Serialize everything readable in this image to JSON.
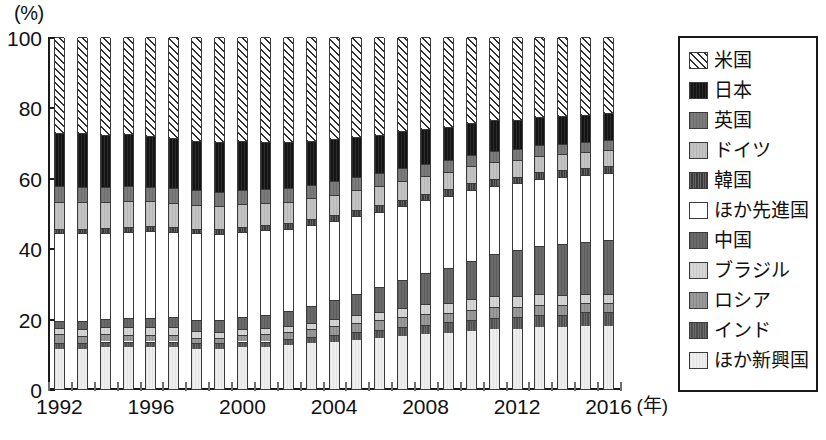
{
  "axes": {
    "y_unit": "(%)",
    "y_ticks": [
      0,
      20,
      40,
      60,
      80,
      100
    ],
    "x_unit": "(年)",
    "x_labels": [
      "1992",
      "1996",
      "2000",
      "2004",
      "2008",
      "2012",
      "2016"
    ]
  },
  "legend": {
    "items": [
      {
        "label": "米国",
        "key": "us",
        "fill": "#ffffff",
        "pattern": "diagonal-hatch"
      },
      {
        "label": "日本",
        "key": "jp",
        "fill": "#141414",
        "pattern": "solid"
      },
      {
        "label": "英国",
        "key": "uk",
        "fill": "#7b7b7b",
        "pattern": "solid"
      },
      {
        "label": "ドイツ",
        "key": "de",
        "fill": "#c4c4c4",
        "pattern": "solid"
      },
      {
        "label": "韓国",
        "key": "kr",
        "fill": "#3a3a3a",
        "pattern": "vertical-lines"
      },
      {
        "label": "ほか先進国",
        "key": "adv",
        "fill": "#ffffff",
        "pattern": "none"
      },
      {
        "label": "中国",
        "key": "cn",
        "fill": "#6a6a6a",
        "pattern": "solid"
      },
      {
        "label": "ブラジル",
        "key": "br",
        "fill": "#d6d6d6",
        "pattern": "solid"
      },
      {
        "label": "ロシア",
        "key": "ru",
        "fill": "#9a9a9a",
        "pattern": "solid"
      },
      {
        "label": "インド",
        "key": "in",
        "fill": "#4f4f4f",
        "pattern": "vertical-lines"
      },
      {
        "label": "ほか新興国",
        "key": "emg",
        "fill": "#eeeeee",
        "pattern": "solid"
      }
    ]
  },
  "chart_data": {
    "type": "bar",
    "stacked": true,
    "title": "",
    "xlabel": "(年)",
    "ylabel": "(%)",
    "ylim": [
      0,
      100
    ],
    "grid": false,
    "legend_position": "right",
    "categories": [
      "1992",
      "1993",
      "1994",
      "1995",
      "1996",
      "1997",
      "1998",
      "1999",
      "2000",
      "2001",
      "2002",
      "2003",
      "2004",
      "2005",
      "2006",
      "2007",
      "2008",
      "2009",
      "2010",
      "2011",
      "2012",
      "2013",
      "2014",
      "2015",
      "2016"
    ],
    "stack_order_bottom_to_top": [
      "emg",
      "in",
      "ru",
      "br",
      "cn",
      "adv",
      "kr",
      "de",
      "uk",
      "jp",
      "us"
    ],
    "series": [
      {
        "name": "ほか新興国",
        "key": "emg",
        "values": [
          11.5,
          11.5,
          12.0,
          12.0,
          12.0,
          12.0,
          11.5,
          11.5,
          12.0,
          12.0,
          12.5,
          13.0,
          13.5,
          14.0,
          14.5,
          15.0,
          15.5,
          16.0,
          16.5,
          17.0,
          17.0,
          17.5,
          17.5,
          18.0,
          18.0
        ]
      },
      {
        "name": "インド",
        "key": "in",
        "values": [
          1.5,
          1.5,
          1.5,
          1.5,
          1.5,
          1.5,
          1.5,
          1.5,
          1.5,
          1.5,
          1.6,
          1.8,
          2.0,
          2.2,
          2.4,
          2.6,
          2.8,
          3.0,
          3.2,
          3.3,
          3.4,
          3.5,
          3.6,
          3.8,
          4.0
        ]
      },
      {
        "name": "ロシア",
        "key": "ru",
        "values": [
          2.5,
          2.2,
          2.0,
          1.8,
          1.8,
          1.8,
          1.5,
          1.5,
          1.8,
          2.0,
          2.0,
          2.2,
          2.4,
          2.5,
          2.6,
          2.8,
          3.0,
          2.6,
          2.8,
          3.0,
          3.0,
          3.0,
          2.8,
          2.5,
          2.4
        ]
      },
      {
        "name": "ブラジル",
        "key": "br",
        "values": [
          1.8,
          1.8,
          2.0,
          2.2,
          2.2,
          2.2,
          2.0,
          1.8,
          1.8,
          1.8,
          1.8,
          1.8,
          2.0,
          2.2,
          2.4,
          2.6,
          2.8,
          2.8,
          3.0,
          3.0,
          3.0,
          2.9,
          2.8,
          2.6,
          2.5
        ]
      },
      {
        "name": "中国",
        "key": "cn",
        "values": [
          2.0,
          2.2,
          2.4,
          2.6,
          2.8,
          3.0,
          3.2,
          3.3,
          3.5,
          3.8,
          4.2,
          4.8,
          5.4,
          6.2,
          7.0,
          8.0,
          9.0,
          10.0,
          11.0,
          12.0,
          13.0,
          13.8,
          14.5,
          15.0,
          15.5
        ]
      },
      {
        "name": "ほか先進国",
        "key": "adv",
        "values": [
          25.0,
          25.0,
          24.5,
          24.5,
          24.5,
          24.0,
          24.5,
          24.5,
          24.0,
          24.0,
          23.5,
          23.0,
          22.5,
          22.0,
          21.5,
          21.0,
          20.5,
          20.5,
          20.0,
          19.5,
          19.0,
          19.0,
          19.0,
          19.0,
          19.0
        ]
      },
      {
        "name": "韓国",
        "key": "kr",
        "values": [
          1.3,
          1.3,
          1.4,
          1.5,
          1.5,
          1.5,
          1.3,
          1.4,
          1.5,
          1.5,
          1.6,
          1.6,
          1.7,
          1.7,
          1.8,
          1.8,
          1.8,
          1.8,
          1.9,
          1.9,
          1.9,
          1.9,
          1.9,
          1.9,
          1.9
        ]
      },
      {
        "name": "ドイツ",
        "key": "de",
        "values": [
          7.5,
          7.5,
          7.2,
          7.2,
          7.0,
          6.8,
          6.8,
          6.6,
          6.4,
          6.2,
          6.0,
          6.0,
          5.8,
          5.6,
          5.5,
          5.4,
          5.2,
          5.0,
          4.9,
          4.8,
          4.7,
          4.6,
          4.6,
          4.5,
          4.5
        ]
      },
      {
        "name": "英国",
        "key": "uk",
        "values": [
          4.5,
          4.4,
          4.3,
          4.3,
          4.2,
          4.2,
          4.1,
          4.0,
          4.0,
          4.0,
          3.9,
          3.8,
          3.8,
          3.7,
          3.6,
          3.5,
          3.4,
          3.3,
          3.2,
          3.2,
          3.1,
          3.1,
          3.0,
          3.0,
          3.0
        ]
      },
      {
        "name": "日本",
        "key": "jp",
        "values": [
          15.0,
          15.2,
          15.0,
          14.8,
          14.5,
          14.2,
          14.0,
          14.2,
          14.0,
          13.5,
          13.0,
          12.5,
          12.0,
          11.5,
          11.0,
          10.5,
          10.0,
          9.5,
          9.0,
          8.6,
          8.3,
          8.0,
          7.8,
          7.6,
          7.5
        ]
      },
      {
        "name": "米国",
        "key": "us",
        "values": [
          27.4,
          27.4,
          27.7,
          27.6,
          28.0,
          28.8,
          29.6,
          29.7,
          29.5,
          29.7,
          29.9,
          29.5,
          29.0,
          28.4,
          27.7,
          26.8,
          26.0,
          25.5,
          24.5,
          23.7,
          23.6,
          22.7,
          22.5,
          22.1,
          21.7
        ]
      }
    ]
  }
}
